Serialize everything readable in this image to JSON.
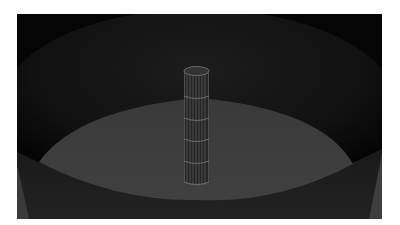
{
  "scene": {
    "description": "3D render of a wireframe cylinder standing on a circular floor inside a large cylindrical enclosure",
    "colors": {
      "background": "#050505",
      "wall_back": "#161616",
      "wall_front": "#1e1e1e",
      "wall_side_light": "#3a3a3a",
      "floor": "#3d3d3d",
      "cylinder_body": "#262626",
      "cylinder_top": "#333333",
      "wire_lines": "#7a7a7a"
    },
    "cylinder": {
      "segments_horizontal": 5,
      "segments_vertical": 10
    }
  }
}
